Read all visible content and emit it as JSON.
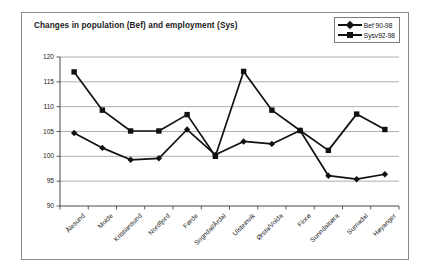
{
  "chart_data": {
    "type": "line",
    "title": "Changes in population (Bef) and employment (Sys)",
    "xlabel": "",
    "ylabel": "",
    "ylim": [
      90,
      120
    ],
    "yticks": [
      90,
      95,
      100,
      105,
      110,
      115,
      120
    ],
    "grid": true,
    "legend_position": "top-right",
    "categories": [
      "Ålesund",
      "Molde",
      "Kristiansund",
      "Nordfjord",
      "Førde",
      "Sogndal/Årdal",
      "Ulsteinvik",
      "Ørsta/Volda",
      "Florø",
      "Sunndalsøra",
      "Surnadal",
      "Høyanger"
    ],
    "series": [
      {
        "name": "Bef 90-98",
        "marker": "diamond",
        "color": "#111111",
        "values": [
          104.7,
          101.7,
          99.3,
          99.6,
          105.4,
          100.3,
          103.0,
          102.5,
          105.2,
          96.1,
          95.4,
          96.4
        ]
      },
      {
        "name": "Sysv92-98",
        "marker": "square",
        "color": "#111111",
        "values": [
          117.0,
          109.3,
          105.1,
          105.1,
          108.4,
          100.0,
          117.1,
          109.3,
          105.2,
          101.2,
          108.5,
          105.4
        ]
      }
    ]
  },
  "legend": {
    "items": [
      {
        "label": "Bef 90-98"
      },
      {
        "label": "Sysv92-98"
      }
    ]
  }
}
